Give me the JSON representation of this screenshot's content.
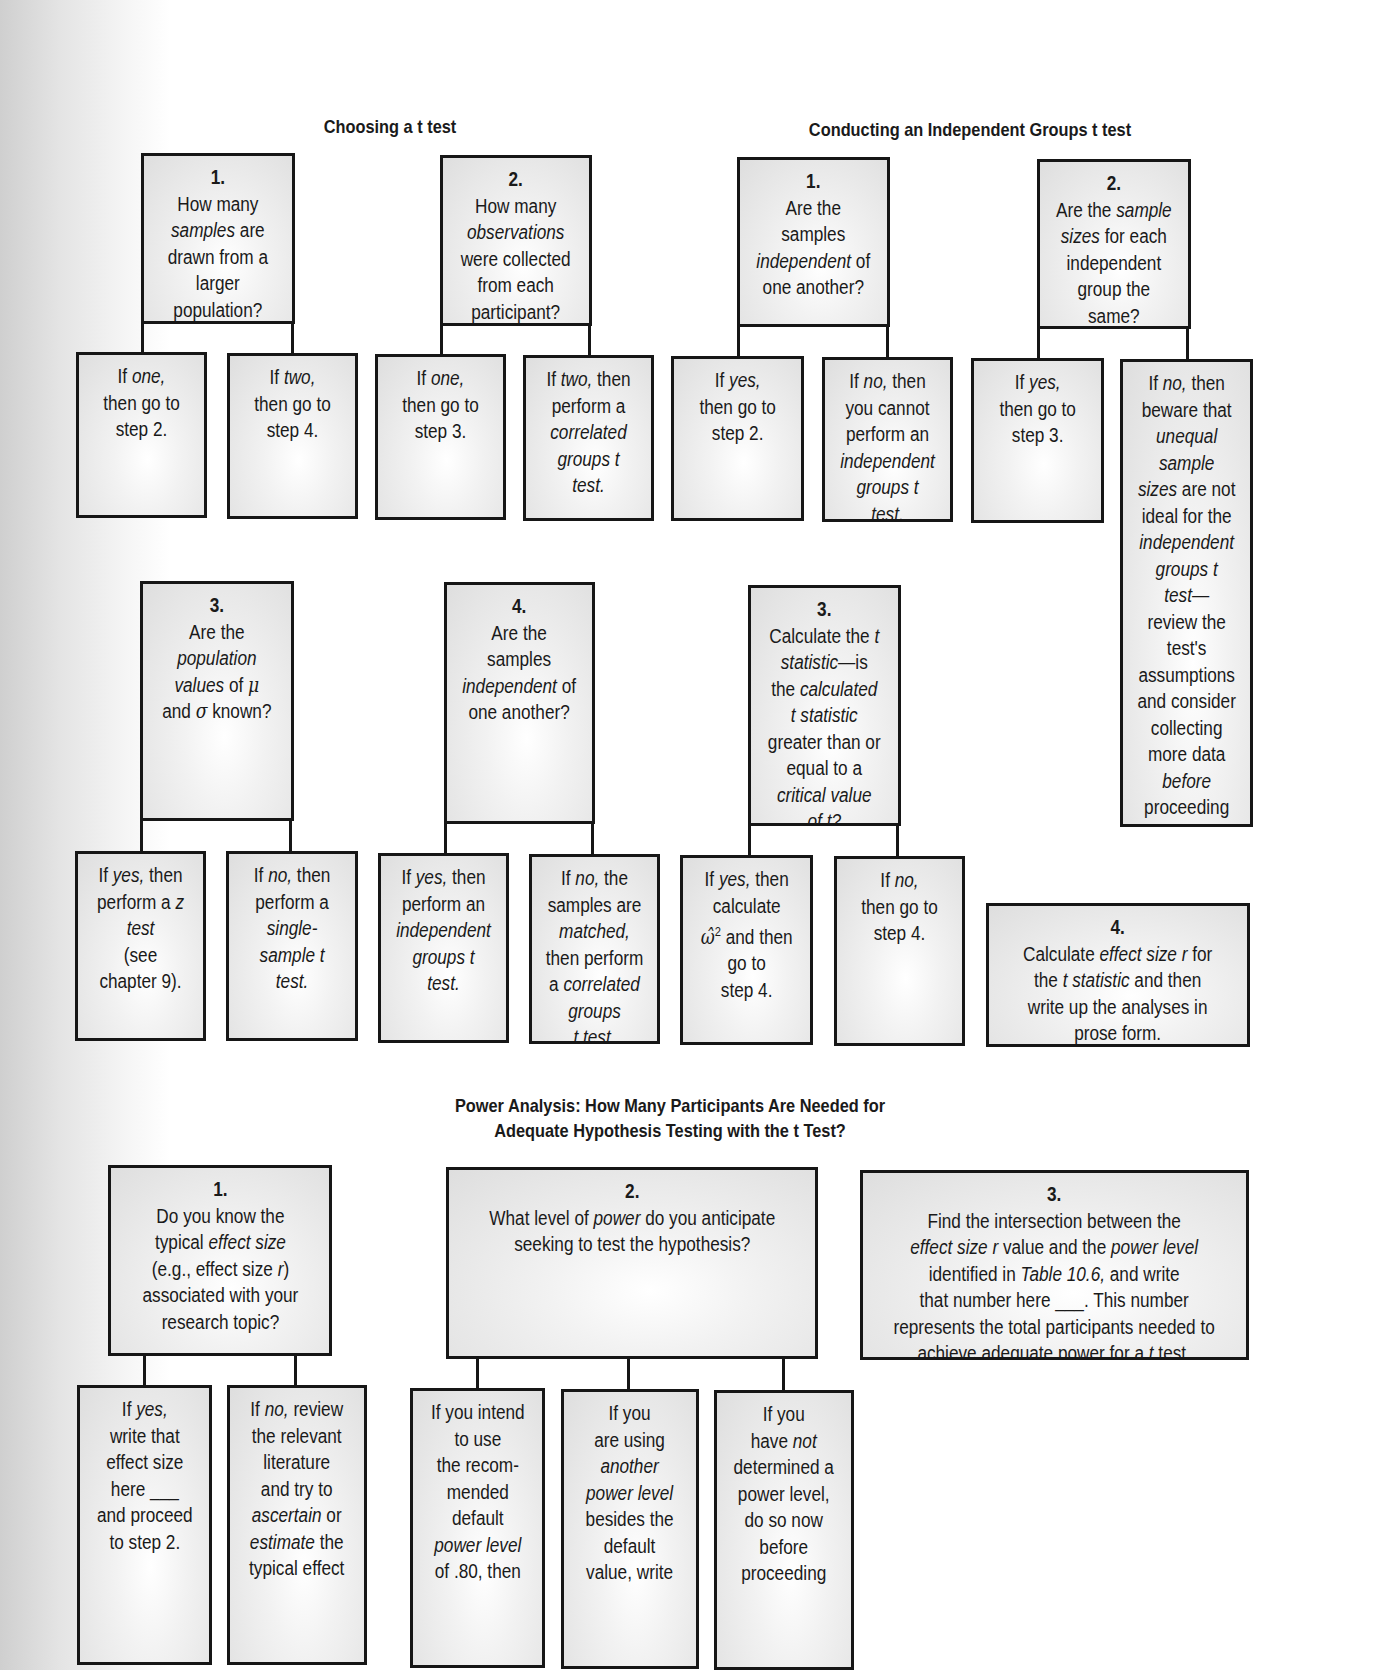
{
  "sections": {
    "choosing": {
      "title": "Choosing a t test",
      "step1": {
        "num": "1.",
        "lines": [
          "How many",
          "samples are",
          "drawn from a",
          "larger",
          "population?"
        ]
      },
      "step1_yes": {
        "lines": [
          "If one,",
          "then go to",
          "step 2."
        ]
      },
      "step1_no": {
        "lines": [
          "If two,",
          "then go to",
          "step 4."
        ]
      },
      "step2": {
        "num": "2.",
        "lines": [
          "How many",
          "observations",
          "were collected",
          "from each",
          "participant?"
        ]
      },
      "step2_a": {
        "lines": [
          "If one,",
          "then go to",
          "step 3."
        ]
      },
      "step2_b": {
        "lines": [
          "If two, then",
          "perform a",
          "correlated",
          "groups t",
          "test."
        ]
      },
      "step3": {
        "num": "3.",
        "lines": [
          "Are the",
          "population",
          "values of μ",
          "and σ known?"
        ]
      },
      "step3_yes": {
        "lines": [
          "If yes, then",
          "perform a z",
          "test",
          "(see",
          "chapter 9)."
        ]
      },
      "step3_no": {
        "lines": [
          "If no, then",
          "perform a",
          "single-",
          "sample t",
          "test."
        ]
      },
      "step4": {
        "num": "4.",
        "lines": [
          "Are the",
          "samples",
          "independent of",
          "one another?"
        ]
      },
      "step4_yes": {
        "lines": [
          "If yes, then",
          "perform an",
          "independent",
          "groups t",
          "test."
        ]
      },
      "step4_no": {
        "lines": [
          "If no, the",
          "samples are",
          "matched,",
          "then perform",
          "a correlated",
          "groups",
          "t test."
        ]
      }
    },
    "conducting": {
      "title": "Conducting an Independent Groups t test",
      "step1": {
        "num": "1.",
        "lines": [
          "Are the",
          "samples",
          "independent of",
          "one another?"
        ]
      },
      "step1_yes": {
        "lines": [
          "If yes,",
          "then go to",
          "step 2."
        ]
      },
      "step1_no": {
        "lines": [
          "If no, then",
          "you cannot",
          "perform an",
          "independent",
          "groups t",
          "test."
        ]
      },
      "step2": {
        "num": "2.",
        "lines": [
          "Are the sample",
          "sizes for each",
          "independent",
          "group the",
          "same?"
        ]
      },
      "step2_yes": {
        "lines": [
          "If yes,",
          "then go to",
          "step 3."
        ]
      },
      "step2_no": {
        "lines": [
          "If no, then",
          "beware that",
          "unequal",
          "sample",
          "sizes are not",
          "ideal for the",
          "independent",
          "groups t",
          "test—",
          "review the",
          "test's",
          "assumptions",
          "and consider",
          "collecting",
          "more data",
          "before",
          "proceeding",
          "to step 3."
        ]
      },
      "step3": {
        "num": "3.",
        "lines": [
          "Calculate the t",
          "statistic—is",
          "the calculated",
          "t statistic",
          "greater than or",
          "equal to a",
          "critical value",
          "of t?"
        ]
      },
      "step3_yes": {
        "lines": [
          "If yes, then",
          "calculate",
          "ω̂² and then",
          "go to",
          "step 4."
        ]
      },
      "step3_no": {
        "lines": [
          "If no,",
          "then go to",
          "step 4."
        ]
      },
      "step4": {
        "num": "4.",
        "lines": [
          "Calculate effect size r for",
          "the t statistic and then",
          "write up the analyses in",
          "prose form."
        ]
      }
    },
    "power": {
      "title_line1": "Power Analysis: How Many Participants Are Needed for",
      "title_line2": "Adequate Hypothesis Testing with the t Test?",
      "step1": {
        "num": "1.",
        "lines": [
          "Do you know the",
          "typical effect size",
          "(e.g., effect size r)",
          "associated with your",
          "research topic?"
        ]
      },
      "step1_yes": {
        "lines": [
          "If yes,",
          "write that",
          "effect size",
          "here ___",
          "and proceed",
          "to step 2."
        ]
      },
      "step1_no": {
        "lines": [
          "If no, review",
          "the relevant",
          "literature",
          "and try to",
          "ascertain or",
          "estimate the",
          "typical effect"
        ]
      },
      "step2": {
        "num": "2.",
        "lines": [
          "What level of power do you anticipate",
          "seeking to test the hypothesis?"
        ]
      },
      "step2_a": {
        "lines": [
          "If you intend",
          "to use",
          "the recom-",
          "mended",
          "default",
          "power level",
          "of .80, then"
        ]
      },
      "step2_b": {
        "lines": [
          "If you",
          "are using",
          "another",
          "power level",
          "besides the",
          "default",
          "value, write"
        ]
      },
      "step2_c": {
        "lines": [
          "If you",
          "have not",
          "determined a",
          "power level,",
          "do so now",
          "before",
          "proceeding"
        ]
      },
      "step3": {
        "num": "3.",
        "lines": [
          "Find the intersection between the",
          "effect size r value and the power level",
          "identified in Table 10.6, and write",
          "that number here ___. This number",
          "represents the total participants needed to",
          "achieve adequate power for a t test."
        ]
      }
    }
  }
}
